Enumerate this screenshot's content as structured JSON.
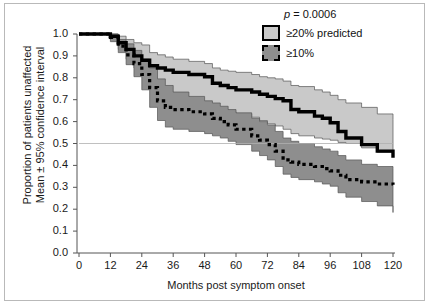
{
  "figure": {
    "frame_color": "#b9b9b9",
    "background": "#ffffff"
  },
  "axes": {
    "y_title": "Proportion of patients unaffected\nMean ± 95% confidence interval",
    "x_title": "Months post symptom onset",
    "y_ticks": [
      "0.0",
      "0.1",
      "0.2",
      "0.3",
      "0.4",
      "0.5",
      "0.6",
      "0.7",
      "0.8",
      "0.9",
      "1.0"
    ],
    "x_ticks": [
      "0",
      "12",
      "24",
      "36",
      "48",
      "60",
      "72",
      "84",
      "96",
      "108",
      "120"
    ]
  },
  "legend": {
    "p_value": "p = 0.0006",
    "entries": [
      {
        "label": "≥20% predicted",
        "swatch": "light-gray-solid-border",
        "fill": "#c9c9c9",
        "border": "#000000",
        "border_style": "solid"
      },
      {
        "label": "≥10%",
        "swatch": "dark-gray-dashed-border",
        "fill": "#8e8e8e",
        "border": "#000000",
        "border_style": "dashed"
      }
    ]
  },
  "chart_data": {
    "type": "line",
    "title": "",
    "xlabel": "Months post symptom onset",
    "ylabel": "Proportion of patients unaffected Mean ± 95% confidence interval",
    "xlim": [
      0,
      120
    ],
    "ylim": [
      0.0,
      1.0
    ],
    "grid": false,
    "reference_line_y": 0.5,
    "legend_position": "top-right",
    "annotations": [
      "p = 0.0006"
    ],
    "x": [
      0,
      6,
      12,
      15,
      18,
      21,
      24,
      27,
      30,
      33,
      36,
      42,
      48,
      51,
      54,
      57,
      60,
      66,
      69,
      72,
      75,
      78,
      81,
      84,
      90,
      93,
      96,
      99,
      102,
      108,
      114,
      120
    ],
    "series": [
      {
        "name": "≥20% predicted",
        "style": "solid-thick-black",
        "color": "#000000",
        "band_fill": "#c9c9c9",
        "values": [
          1.0,
          1.0,
          0.99,
          0.96,
          0.93,
          0.9,
          0.88,
          0.855,
          0.845,
          0.835,
          0.825,
          0.815,
          0.805,
          0.775,
          0.765,
          0.755,
          0.745,
          0.735,
          0.725,
          0.715,
          0.705,
          0.695,
          0.655,
          0.645,
          0.625,
          0.615,
          0.595,
          0.555,
          0.525,
          0.495,
          0.465,
          0.435
        ],
        "ci_upper": [
          1.0,
          1.0,
          1.0,
          0.99,
          0.975,
          0.96,
          0.95,
          0.915,
          0.905,
          0.895,
          0.885,
          0.875,
          0.865,
          0.845,
          0.835,
          0.83,
          0.825,
          0.815,
          0.805,
          0.8,
          0.795,
          0.785,
          0.765,
          0.76,
          0.745,
          0.735,
          0.72,
          0.7,
          0.685,
          0.665,
          0.635,
          0.61
        ],
        "ci_lower": [
          1.0,
          1.0,
          0.975,
          0.93,
          0.885,
          0.845,
          0.81,
          0.775,
          0.755,
          0.735,
          0.715,
          0.69,
          0.675,
          0.665,
          0.655,
          0.645,
          0.635,
          0.62,
          0.605,
          0.59,
          0.58,
          0.565,
          0.545,
          0.535,
          0.525,
          0.52,
          0.515,
          0.505,
          0.5,
          0.48,
          0.46,
          0.445
        ]
      },
      {
        "name": "≥10%",
        "style": "dotted-thick-black",
        "color": "#000000",
        "band_fill": "#8e8e8e",
        "values": [
          1.0,
          1.0,
          0.985,
          0.945,
          0.905,
          0.865,
          0.815,
          0.755,
          0.695,
          0.665,
          0.655,
          0.645,
          0.635,
          0.615,
          0.6,
          0.585,
          0.565,
          0.535,
          0.515,
          0.495,
          0.465,
          0.425,
          0.415,
          0.405,
          0.395,
          0.385,
          0.375,
          0.355,
          0.335,
          0.325,
          0.315,
          0.312
        ],
        "ci_upper": [
          1.0,
          1.0,
          1.0,
          0.975,
          0.955,
          0.925,
          0.885,
          0.845,
          0.795,
          0.765,
          0.735,
          0.715,
          0.695,
          0.685,
          0.67,
          0.655,
          0.64,
          0.615,
          0.6,
          0.585,
          0.555,
          0.525,
          0.51,
          0.5,
          0.485,
          0.475,
          0.465,
          0.445,
          0.425,
          0.405,
          0.395,
          0.385
        ],
        "ci_lower": [
          1.0,
          1.0,
          0.965,
          0.915,
          0.86,
          0.805,
          0.745,
          0.665,
          0.605,
          0.575,
          0.565,
          0.555,
          0.545,
          0.535,
          0.525,
          0.51,
          0.495,
          0.465,
          0.445,
          0.425,
          0.395,
          0.36,
          0.345,
          0.335,
          0.325,
          0.315,
          0.305,
          0.275,
          0.255,
          0.235,
          0.215,
          0.185
        ]
      }
    ]
  }
}
